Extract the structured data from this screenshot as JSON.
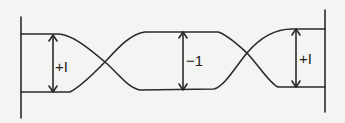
{
  "diagram": {
    "type": "line-crossing schematic",
    "stroke_color": "#2a2a2a",
    "background": "#f4f4f2",
    "segments": [
      {
        "id": "left",
        "label": "+I",
        "description": "separation measured between upper and lower lines near left wall"
      },
      {
        "id": "middle",
        "label": "−1",
        "description": "separation between lines after first crossing"
      },
      {
        "id": "right",
        "label": "+I",
        "description": "separation near right wall after second crossing"
      }
    ],
    "crossings": 2,
    "walls": [
      "left-vertical-bar",
      "right-vertical-bar"
    ]
  }
}
